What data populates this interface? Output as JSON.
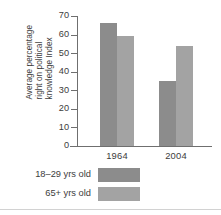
{
  "chart_data": {
    "type": "bar",
    "title": "",
    "xlabel": "",
    "ylabel": "Average percentage right on political knowledge Index",
    "ylabel_lines": [
      "Average percentage",
      "right on political",
      "knowledge Index"
    ],
    "categories": [
      "1964",
      "2004"
    ],
    "series": [
      {
        "name": "18–29 yrs old",
        "values": [
          66,
          35
        ],
        "color": "#8c8c8c"
      },
      {
        "name": "65+ yrs old",
        "values": [
          59,
          54
        ],
        "color": "#a3a3a3"
      }
    ],
    "ylim": [
      0,
      70
    ],
    "yticks": [
      0,
      10,
      20,
      30,
      40,
      50,
      60,
      70
    ],
    "ytick_labels": [
      "0",
      "10",
      "20",
      "30",
      "40",
      "50",
      "60",
      "70"
    ],
    "grid": false,
    "legend_position": "bottom-left",
    "axis_color": "#6f6f6f"
  },
  "legend": {
    "items": [
      {
        "label": "18–29 yrs old",
        "color": "#8c8c8c"
      },
      {
        "label": "65+ yrs old",
        "color": "#a3a3a3"
      }
    ]
  }
}
